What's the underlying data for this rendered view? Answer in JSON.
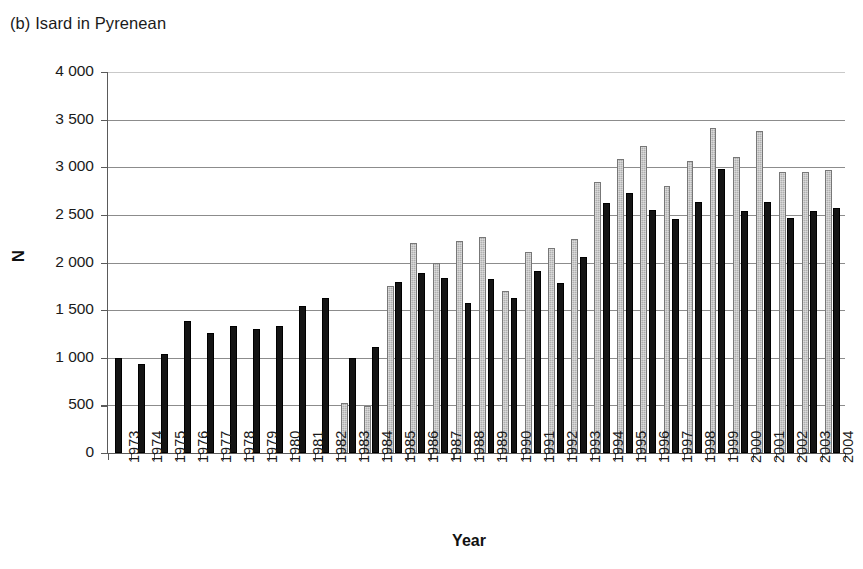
{
  "chart_data": {
    "type": "bar",
    "title": "(b) Isard in Pyrenean",
    "xlabel": "Year",
    "ylabel": "N",
    "ylim": [
      0,
      4000
    ],
    "ytick_values": [
      0,
      500,
      1000,
      1500,
      2000,
      2500,
      3000,
      3500,
      4000
    ],
    "ytick_labels": [
      "0",
      "500",
      "1 000",
      "1 500",
      "2 000",
      "2 500",
      "3 000",
      "3 500",
      "4 000"
    ],
    "grid": "horizontal",
    "legend": "none",
    "categories": [
      "1973",
      "1974",
      "1975",
      "1976",
      "1977",
      "1978",
      "1979",
      "1980",
      "1981",
      "1982",
      "1983",
      "1984",
      "1985",
      "1986",
      "1987",
      "1988",
      "1989",
      "1990",
      "1991",
      "1992",
      "1993",
      "1994",
      "1995",
      "1996",
      "1997",
      "1998",
      "1999",
      "2000",
      "2001",
      "2002",
      "2003",
      "2004"
    ],
    "series": [
      {
        "name": "series-gray",
        "color": "#b0b0b0",
        "values": [
          null,
          null,
          null,
          null,
          null,
          null,
          null,
          null,
          null,
          null,
          525,
          490,
          1755,
          2205,
          2000,
          2230,
          2265,
          1700,
          2110,
          2155,
          2250,
          2850,
          3090,
          3220,
          2800,
          3070,
          3415,
          3110,
          3380,
          2950,
          2950,
          2975
        ]
      },
      {
        "name": "series-black",
        "color": "#141414",
        "values": [
          995,
          935,
          1040,
          1385,
          1265,
          1330,
          1305,
          1335,
          1545,
          1625,
          995,
          1115,
          1800,
          1885,
          1835,
          1570,
          1825,
          1630,
          1915,
          1790,
          2055,
          2620,
          2730,
          2555,
          2455,
          2640,
          2985,
          2540,
          2640,
          2470,
          2545,
          2575
        ]
      }
    ]
  }
}
